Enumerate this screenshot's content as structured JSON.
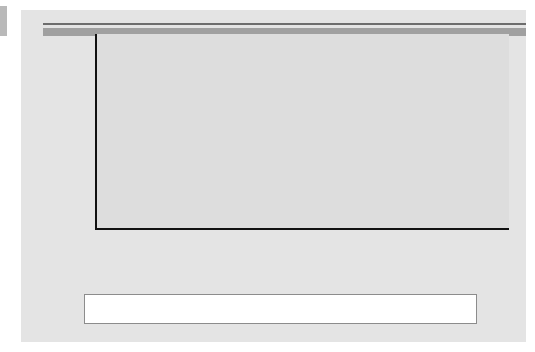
{
  "figure": {
    "ylabel": "$ billions",
    "legend": {
      "items": [
        {
          "label": "Developed Countries",
          "swatch": "dark-gray-swatch-icon",
          "color": "#3f3f3f"
        },
        {
          "label": "Developing Countries",
          "swatch": "light-gray-swatch-icon",
          "color": "#b2b2b2"
        }
      ]
    },
    "colors": {
      "plot_background": "#dddddd",
      "figure_background": "#e4e4e4",
      "gridline": "#f4f4f4",
      "axis": "#111111",
      "developed": "#4f4f4f",
      "developing": "#b2b2b2"
    }
  },
  "chart_data": {
    "type": "bar",
    "stacked": true,
    "title": "",
    "xlabel": "",
    "ylabel": "$ billions",
    "ylim": [
      0,
      2200
    ],
    "ytick_step": 200,
    "yticks": [
      2200,
      2000,
      1800,
      1600,
      1400,
      1200,
      1000,
      800,
      600,
      400,
      200,
      0
    ],
    "grid": true,
    "legend_position": "bottom",
    "categories": [
      "1988–93",
      "1994",
      "1995",
      "1996",
      "1997",
      "1998",
      "1999",
      "2000",
      "2001",
      "2002",
      "2003",
      "2004",
      "2005",
      "2006",
      "2007",
      "2008",
      "2009"
    ],
    "series": [
      {
        "name": "Developed Countries",
        "color": "#4f4f4f",
        "values": [
          140,
          145,
          215,
          240,
          280,
          460,
          830,
          1080,
          580,
          490,
          380,
          410,
          590,
          860,
          1400,
          990,
          520
        ]
      },
      {
        "name": "Developing Countries",
        "color": "#b2b2b2",
        "values": [
          60,
          105,
          115,
          150,
          200,
          210,
          220,
          270,
          220,
          160,
          180,
          300,
          190,
          370,
          600,
          640,
          500
        ]
      }
    ],
    "totals": [
      200,
      250,
      330,
      390,
      480,
      670,
      1050,
      1350,
      800,
      650,
      560,
      710,
      780,
      1230,
      2000,
      1630,
      1020
    ]
  }
}
